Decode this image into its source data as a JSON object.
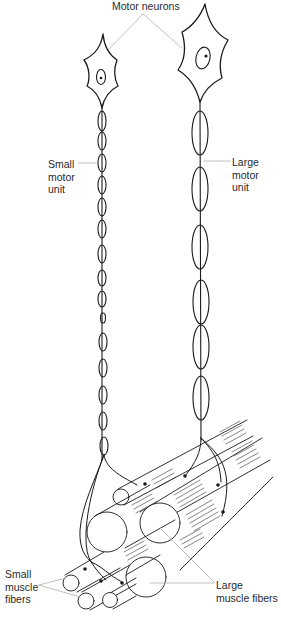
{
  "figure": {
    "labels": {
      "motor_neurons": "Motor neurons",
      "small_motor_unit": "Small\nmotor\nunit",
      "large_motor_unit": "Large\nmotor\nunit",
      "small_muscle_fibers": "Small\nmuscle\nfibers",
      "large_muscle_fibers": "Large\nmuscle fibers"
    },
    "colors": {
      "ink": "#1a1a1a",
      "leader_line": "#b0b0b0",
      "background": "#ffffff"
    }
  },
  "components": {
    "small_neuron": {
      "axon_segments": 16
    },
    "large_neuron": {
      "axon_segments": 7
    },
    "small_muscle_fibers": {
      "count": 3
    },
    "large_muscle_fibers": {
      "count": 3
    }
  }
}
